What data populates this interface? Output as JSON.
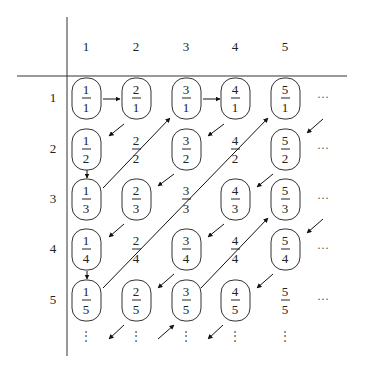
{
  "diagram": {
    "column_headers": [
      "1",
      "2",
      "3",
      "4",
      "5"
    ],
    "row_headers": [
      "1",
      "2",
      "3",
      "4",
      "5"
    ],
    "cells": [
      [
        {
          "num": "1",
          "den": "1",
          "boxed": true
        },
        {
          "num": "2",
          "den": "1",
          "boxed": true
        },
        {
          "num": "3",
          "den": "1",
          "boxed": true
        },
        {
          "num": "4",
          "den": "1",
          "boxed": true
        },
        {
          "num": "5",
          "den": "1",
          "boxed": true
        }
      ],
      [
        {
          "num": "1",
          "den": "2",
          "boxed": true
        },
        {
          "num": "2",
          "den": "2",
          "boxed": false
        },
        {
          "num": "3",
          "den": "2",
          "boxed": true
        },
        {
          "num": "4",
          "den": "2",
          "boxed": false
        },
        {
          "num": "5",
          "den": "2",
          "boxed": true
        }
      ],
      [
        {
          "num": "1",
          "den": "3",
          "boxed": true
        },
        {
          "num": "2",
          "den": "3",
          "boxed": true
        },
        {
          "num": "3",
          "den": "3",
          "boxed": false
        },
        {
          "num": "4",
          "den": "3",
          "boxed": true
        },
        {
          "num": "5",
          "den": "3",
          "boxed": true
        }
      ],
      [
        {
          "num": "1",
          "den": "4",
          "boxed": true
        },
        {
          "num": "2",
          "den": "4",
          "boxed": false
        },
        {
          "num": "3",
          "den": "4",
          "boxed": true
        },
        {
          "num": "4",
          "den": "4",
          "boxed": false
        },
        {
          "num": "5",
          "den": "4",
          "boxed": true
        }
      ],
      [
        {
          "num": "1",
          "den": "5",
          "boxed": true
        },
        {
          "num": "2",
          "den": "5",
          "boxed": true
        },
        {
          "num": "3",
          "den": "5",
          "boxed": true
        },
        {
          "num": "4",
          "den": "5",
          "boxed": true
        },
        {
          "num": "5",
          "den": "5",
          "boxed": false
        }
      ]
    ],
    "row_continuation": "···",
    "column_continuation": "⋮",
    "arrows": [
      {
        "from": "1/1",
        "to": "2/1",
        "kind": "horizontal"
      },
      {
        "from": "2/1",
        "to": "1/2",
        "kind": "diagonal-down-left"
      },
      {
        "from": "1/2",
        "to": "1/3",
        "kind": "vertical"
      },
      {
        "from": "1/3",
        "to": "3/1",
        "kind": "diagonal-up-right",
        "passes": [
          "2/2"
        ]
      },
      {
        "from": "3/1",
        "to": "4/1",
        "kind": "horizontal"
      },
      {
        "from": "4/1",
        "to": "3/2",
        "kind": "diagonal-down-left"
      },
      {
        "from": "3/2",
        "to": "2/3",
        "kind": "diagonal-down-left"
      },
      {
        "from": "2/3",
        "to": "1/4",
        "kind": "diagonal-down-left"
      },
      {
        "from": "1/4",
        "to": "1/5",
        "kind": "vertical"
      },
      {
        "from": "1/5",
        "to": "5/1",
        "kind": "diagonal-up-right",
        "passes": [
          "2/4",
          "3/3",
          "4/2"
        ]
      },
      {
        "from": "6/1",
        "to": "5/2",
        "kind": "diagonal-down-left"
      },
      {
        "from": "5/2",
        "to": "4/3",
        "kind": "diagonal-down-left"
      },
      {
        "from": "4/3",
        "to": "3/4",
        "kind": "diagonal-down-left"
      },
      {
        "from": "3/4",
        "to": "2/5",
        "kind": "diagonal-down-left"
      },
      {
        "from": "2/5",
        "to": "1/6",
        "kind": "diagonal-down-left"
      },
      {
        "from": "2/6",
        "to": "3/5",
        "kind": "diagonal-up-right"
      },
      {
        "from": "3/5",
        "to": "5/3",
        "kind": "diagonal-up-right",
        "passes": [
          "4/4"
        ]
      },
      {
        "from": "6/3",
        "to": "5/4",
        "kind": "diagonal-down-left"
      },
      {
        "from": "5/4",
        "to": "4/5",
        "kind": "diagonal-down-left"
      },
      {
        "from": "4/5",
        "to": "3/6",
        "kind": "diagonal-down-left"
      }
    ]
  }
}
